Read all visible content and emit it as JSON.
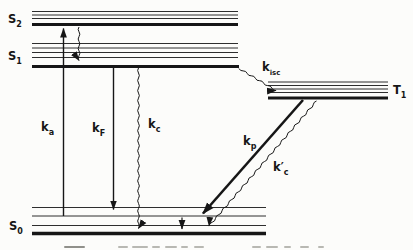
{
  "states": {
    "s2": {
      "base": "S",
      "sub": "2"
    },
    "s1": {
      "base": "S",
      "sub": "1"
    },
    "s0": {
      "base": "S",
      "sub": "0"
    },
    "t1": {
      "base": "T",
      "sub": "1"
    }
  },
  "rates": {
    "ka": {
      "base": "k",
      "sub": "a"
    },
    "kF": {
      "base": "k",
      "sub": "F"
    },
    "kc": {
      "base": "k",
      "sub": "c"
    },
    "kisc": {
      "base": "k",
      "sub": "isc"
    },
    "kp": {
      "base": "k",
      "sub": "p"
    },
    "kcprime": {
      "base": "k′",
      "sub": "c"
    }
  },
  "transitions": [
    {
      "label": "ka",
      "from": "S0",
      "to": "S2",
      "line": "straight",
      "direction": "up"
    },
    {
      "label": null,
      "from": "S2",
      "to": "S1",
      "line": "wavy",
      "direction": "down"
    },
    {
      "label": "kF",
      "from": "S1",
      "to": "S0",
      "line": "straight",
      "direction": "down"
    },
    {
      "label": "kc",
      "from": "S1",
      "to": "S0",
      "line": "wavy",
      "direction": "down"
    },
    {
      "label": "kisc",
      "from": "S1",
      "to": "T1",
      "line": "wavy",
      "direction": "down-right"
    },
    {
      "label": "kp",
      "from": "T1",
      "to": "S0",
      "line": "straight-thick",
      "direction": "down-left"
    },
    {
      "label": "kcprime",
      "from": "T1",
      "to": "S0",
      "line": "wavy",
      "direction": "down-left"
    },
    {
      "label": null,
      "from": "S0-vibrational",
      "to": "S0",
      "line": "straight-short",
      "direction": "down"
    }
  ],
  "levels": {
    "s2": {
      "thin_lines": 3,
      "x": [
        32,
        238
      ],
      "thick_y": 24.5
    },
    "s1": {
      "thin_lines": 4,
      "x": [
        32,
        239
      ],
      "thick_y": 66.5
    },
    "t1": {
      "thin_lines": 4,
      "x": [
        268,
        388
      ],
      "thick_y": 98
    },
    "s0": {
      "thin_lines": 3,
      "x": [
        32,
        266
      ],
      "thick_y": 233.5
    }
  },
  "colors": {
    "ink": "#161616",
    "paper": "#fcfcfa"
  }
}
